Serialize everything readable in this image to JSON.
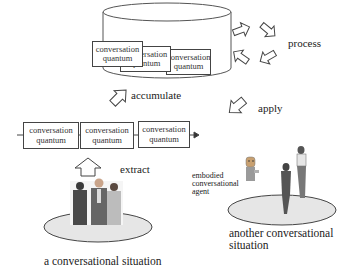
{
  "repository": {
    "quanta": [
      {
        "line1": "conversation",
        "line2": "quantum"
      },
      {
        "line1": "conversation",
        "line2": "quantum"
      },
      {
        "line1": "conversation",
        "line2": "quantum"
      }
    ]
  },
  "labels": {
    "process": "process",
    "accumulate": "accumulate",
    "apply": "apply",
    "extract": "extract",
    "situation_left": "a conversational situation",
    "situation_right_line1": "another conversational",
    "situation_right_line2": "situation",
    "agent_line1": "embodied",
    "agent_line2": "conversational",
    "agent_line3": "agent"
  },
  "timeline": {
    "quanta": [
      {
        "line1": "conversation",
        "line2": "quantum"
      },
      {
        "line1": "conversation",
        "line2": "quantum"
      },
      {
        "line1": "conversation",
        "line2": "quantum"
      }
    ]
  },
  "colors": {
    "stroke": "#444444",
    "platform_fill": "#e6e6e6",
    "text": "#222222"
  }
}
